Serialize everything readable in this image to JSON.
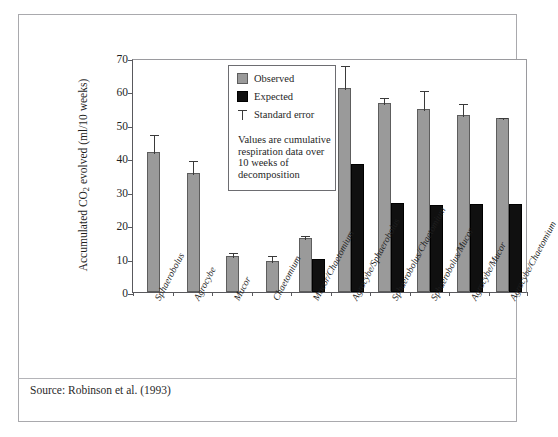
{
  "figure": {
    "source_note": "Source: Robinson et al. (1993)",
    "top_sliver_ghost": "·   ·     ·        ·       ·     ·    ·"
  },
  "legend": {
    "items": [
      {
        "key": "observed",
        "label": "Observed",
        "swatch": "gray-square-icon",
        "color": "#9a9a9a"
      },
      {
        "key": "expected",
        "label": "Expected",
        "swatch": "black-square-icon",
        "color": "#101010"
      },
      {
        "key": "stderr",
        "label": "Standard error",
        "swatch": "error-bar-icon",
        "color": "#3a3a3a"
      }
    ],
    "note": "Values are cumulative respiration data over 10 weeks of decomposition"
  },
  "chart_data": {
    "type": "bar",
    "title": "",
    "subtitle": "",
    "xlabel": "",
    "ylabel": "Accumulated CO2 evolved (ml/10 weeks)",
    "ylabel_parts": {
      "pre": "Accumulated CO",
      "sub": "2",
      "post": " evolved (ml/10 weeks)"
    },
    "ylim": [
      0,
      70
    ],
    "yticks": [
      0,
      10,
      20,
      30,
      40,
      50,
      60,
      70
    ],
    "grid": false,
    "legend_position": "inside-upper-center",
    "orientation": "vertical",
    "error_bar_type": "standard error",
    "categories": [
      "Sphaerobolus",
      "Agrocybe",
      "Mucor",
      "Chaetomium",
      "Mucor/Chaetomium",
      "Agrocybe/Sphaerobolus",
      "Sphaerobolus/Chaetomium",
      "Sphaerobolus/Mucor",
      "Agrocybe/Mucor",
      "Agrocybe/Chaetomium"
    ],
    "series": [
      {
        "name": "Observed",
        "color": "#9a9a9a",
        "values": [
          41.8,
          35.6,
          10.8,
          9.2,
          16.2,
          61.0,
          56.5,
          54.8,
          53.0,
          52.0
        ],
        "errors": [
          5.7,
          4.3,
          1.5,
          2.1,
          1.3,
          7.2,
          2.0,
          6.0,
          3.7,
          0.7
        ]
      },
      {
        "name": "Expected",
        "color": "#101010",
        "values": [
          null,
          null,
          null,
          null,
          10.0,
          38.2,
          26.5,
          25.9,
          26.4,
          26.4
        ],
        "errors": [
          null,
          null,
          null,
          null,
          null,
          null,
          null,
          null,
          null,
          null
        ]
      }
    ]
  }
}
